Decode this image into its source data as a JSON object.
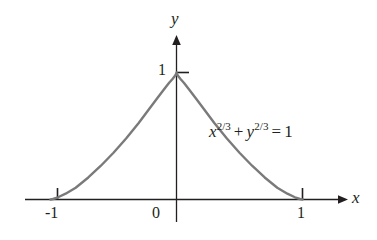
{
  "figure": {
    "kind": "math-plot",
    "background_color": "#ffffff",
    "axis_color": "#231f20",
    "curve_color": "#7a7a7a",
    "text_color": "#231f20"
  },
  "axes": {
    "x_label": "x",
    "y_label": "y",
    "origin_label": "0",
    "x_ticks": [
      {
        "label": "-1",
        "value": -1
      },
      {
        "label": "1",
        "value": 1
      }
    ],
    "y_ticks": [
      {
        "label": "1",
        "value": 1
      }
    ]
  },
  "equation": {
    "base_x": "x",
    "exponent_x": "2/3",
    "operator": "+",
    "base_y": "y",
    "exponent_y": "2/3",
    "equals": "=",
    "right_hand_side": "1",
    "plain_text": "x^2/3 + y^2/3 = 1"
  },
  "chart_data": {
    "type": "line",
    "title": "",
    "subtitle": "",
    "xlabel": "x",
    "ylabel": "y",
    "xlim": [
      -1.35,
      1.35
    ],
    "ylim": [
      -0.22,
      1.35
    ],
    "xticks": [
      -1,
      0,
      1
    ],
    "xticklabels": [
      "-1",
      "0",
      "1"
    ],
    "yticks": [
      1
    ],
    "yticklabels": [
      "1"
    ],
    "grid": false,
    "legend": null,
    "annotations": [
      {
        "text": "x^2/3 + y^2/3 = 1",
        "x": 0.38,
        "y": 0.62
      }
    ],
    "series": [
      {
        "name": "astroid upper half: x^(2/3) + y^(2/3) = 1",
        "color": "#7a7a7a",
        "linewidth": 2.4,
        "x": [
          -1.0,
          -0.98,
          -0.94,
          -0.88,
          -0.8,
          -0.7,
          -0.6,
          -0.5,
          -0.4,
          -0.3,
          -0.22,
          -0.15,
          -0.1,
          -0.06,
          -0.03,
          -0.012,
          -0.003,
          0.0,
          0.003,
          0.012,
          0.03,
          0.06,
          0.1,
          0.15,
          0.22,
          0.3,
          0.4,
          0.5,
          0.6,
          0.7,
          0.8,
          0.88,
          0.94,
          0.98,
          1.0
        ],
        "y": [
          0.0,
          0.0039,
          0.0175,
          0.0457,
          0.0928,
          0.1736,
          0.2658,
          0.3684,
          0.4807,
          0.6026,
          0.7083,
          0.8013,
          0.8664,
          0.9169,
          0.9513,
          0.9735,
          0.9905,
          1.0,
          0.9905,
          0.9735,
          0.9513,
          0.9169,
          0.8664,
          0.8013,
          0.7083,
          0.6026,
          0.4807,
          0.3684,
          0.2658,
          0.1736,
          0.0928,
          0.0457,
          0.0175,
          0.0039,
          0.0
        ]
      }
    ]
  }
}
